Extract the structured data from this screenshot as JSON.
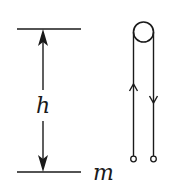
{
  "diagram": {
    "labels": {
      "height": "h",
      "mass": "m"
    },
    "colors": {
      "stroke": "#1a1a1a",
      "background": "#ffffff"
    },
    "elements": [
      "top-level-line",
      "bottom-level-line",
      "height-dimension-arrow",
      "pulley",
      "rope-left-up-arrow",
      "rope-right-down-arrow",
      "rope-end-terminals"
    ]
  }
}
